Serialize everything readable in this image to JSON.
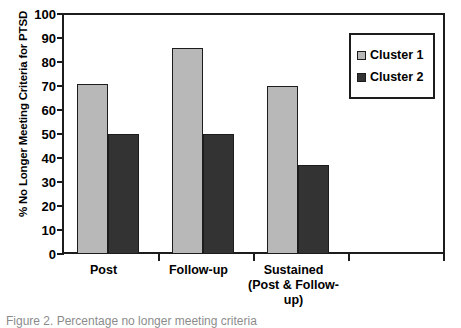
{
  "chart_data": {
    "type": "bar",
    "title": "",
    "xlabel": "",
    "ylabel": "% No Longer Meeting Criteria for PTSD",
    "ylim": [
      0,
      100
    ],
    "yticks": [
      0,
      10,
      20,
      30,
      40,
      50,
      60,
      70,
      80,
      90,
      100
    ],
    "grid": false,
    "legend_position": "top-right",
    "categories": [
      "Post",
      "Follow-up",
      "Sustained (Post & Follow-up)"
    ],
    "category_label_lines": [
      [
        "Post"
      ],
      [
        "Follow-up"
      ],
      [
        "Sustained",
        "(Post & Follow-",
        "up)"
      ]
    ],
    "series": [
      {
        "name": "Cluster 1",
        "color": "#b8b8b8",
        "values": [
          71,
          86,
          70
        ]
      },
      {
        "name": "Cluster 2",
        "color": "#333333",
        "values": [
          50,
          50,
          37
        ]
      }
    ]
  },
  "legend": {
    "items": [
      {
        "label": "Cluster 1"
      },
      {
        "label": "Cluster 2"
      }
    ]
  },
  "axes": {
    "y_label": "% No Longer Meeting Criteria for PTSD",
    "y_tick_labels": [
      "100",
      "90",
      "80",
      "70",
      "60",
      "50",
      "40",
      "30",
      "20",
      "10",
      "0"
    ]
  },
  "caption": {
    "text": "Figure 2. Percentage no longer meeting criteria"
  },
  "colors": {
    "cluster1": "#b8b8b8",
    "cluster2": "#333333",
    "axis": "#1c1c1c",
    "background": "#ffffff"
  }
}
